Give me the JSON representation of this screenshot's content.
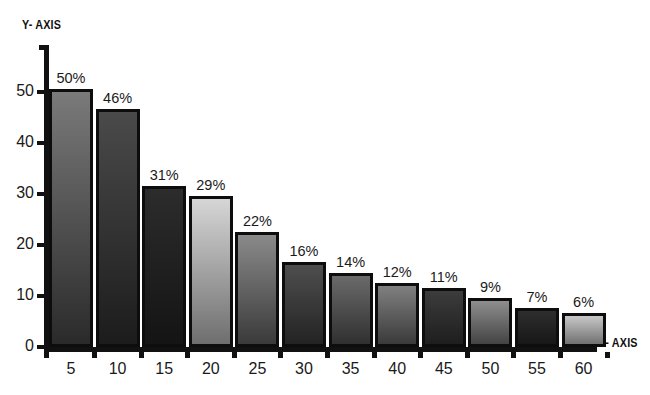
{
  "chart_data": {
    "type": "bar",
    "title": "",
    "xlabel": "X- AXIS",
    "ylabel": "Y- AXIS",
    "categories": [
      "5",
      "10",
      "15",
      "20",
      "25",
      "30",
      "35",
      "40",
      "45",
      "50",
      "55",
      "60"
    ],
    "values": [
      50,
      46,
      31,
      29,
      22,
      16,
      14,
      12,
      11,
      9,
      7,
      6
    ],
    "data_labels": [
      "50%",
      "46%",
      "31%",
      "29%",
      "22%",
      "16%",
      "14%",
      "12%",
      "11%",
      "9%",
      "7%",
      "6%"
    ],
    "ylim": [
      0,
      50
    ],
    "y_ticks": [
      "0",
      "10",
      "20",
      "30",
      "40",
      "50"
    ],
    "y_tick_values": [
      0,
      10,
      20,
      30,
      40,
      50
    ],
    "grid": false,
    "legend": false,
    "bar_colors": [
      {
        "top": "#7a7a7a",
        "bottom": "#2a2a2a"
      },
      {
        "top": "#4a4a4a",
        "bottom": "#1c1c1c"
      },
      {
        "top": "#2c2c2c",
        "bottom": "#141414"
      },
      {
        "top": "#d6d6d6",
        "bottom": "#6e6e6e"
      },
      {
        "top": "#8a8a8a",
        "bottom": "#3a3a3a"
      },
      {
        "top": "#4e4e4e",
        "bottom": "#232323"
      },
      {
        "top": "#6a6a6a",
        "bottom": "#303030"
      },
      {
        "top": "#808080",
        "bottom": "#3a3a3a"
      },
      {
        "top": "#3c3c3c",
        "bottom": "#1e1e1e"
      },
      {
        "top": "#8e8e8e",
        "bottom": "#434343"
      },
      {
        "top": "#2e2e2e",
        "bottom": "#171717"
      },
      {
        "top": "#c8c8c8",
        "bottom": "#707070"
      }
    ],
    "axis_color": "#111111"
  },
  "axes": {
    "y_title": "Y- AXIS",
    "x_title": "X- AXIS"
  }
}
